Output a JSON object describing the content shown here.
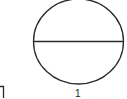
{
  "diagram": {
    "shapes": [
      {
        "type": "circle-split-horizontal",
        "label": "1"
      }
    ],
    "fragment": {
      "type": "bracket-corner"
    }
  },
  "colors": {
    "stroke": "#2a2a2a",
    "background": "#ffffff"
  }
}
